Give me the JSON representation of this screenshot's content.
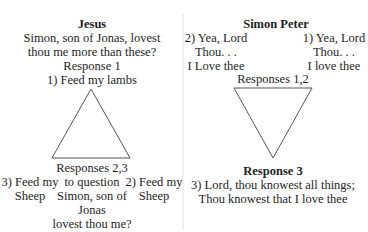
{
  "left_panel": {
    "speaker": "Jesus",
    "question_line1": "Simon, son of Jonas, lovest",
    "question_line2": "thou me more than these?",
    "response_label": "Response 1",
    "response_text": "1) Feed my lambs",
    "bottom_label": "Responses 2,3",
    "bottom_left": [
      "3) Feed my",
      "Sheep"
    ],
    "bottom_center": [
      "to question",
      "Simon, son of",
      "Jonas",
      "lovest thou me?"
    ],
    "bottom_right": [
      "2) Feed my",
      "Sheep"
    ]
  },
  "right_panel": {
    "speaker": "Simon Peter",
    "left_reply": [
      "2) Yea, Lord",
      "Thou. . .",
      "I Love thee"
    ],
    "right_reply": [
      "1) Yea, Lord",
      "Thou. . .",
      "I love thee"
    ],
    "top_label": "Responses 1,2",
    "bottom_heading": "Response 3",
    "bottom_line1": "3) Lord, thou knowest all things;",
    "bottom_line2": "Thou knowest that I love thee"
  },
  "colors": {
    "text": "#1e1e1e",
    "lines": "#555555",
    "divider": "#e4e4e4"
  }
}
